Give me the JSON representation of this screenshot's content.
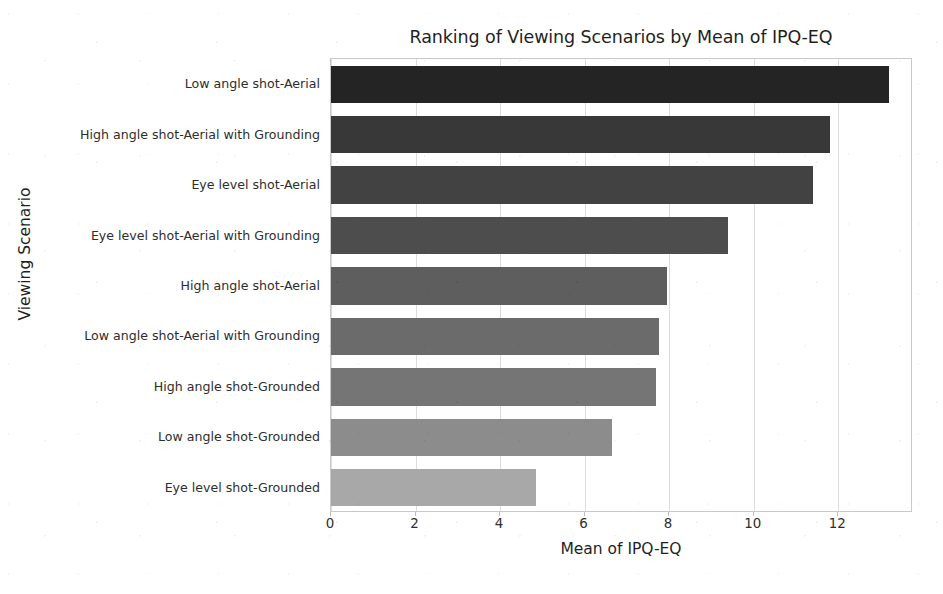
{
  "chart_data": {
    "type": "bar",
    "orientation": "horizontal",
    "title": "Ranking of Viewing Scenarios by Mean of IPQ-EQ",
    "xlabel": "Mean of IPQ-EQ",
    "ylabel": "Viewing Scenario",
    "xlim": [
      0,
      13.77
    ],
    "xticks": [
      0,
      2,
      4,
      6,
      8,
      10,
      12
    ],
    "xticklabels": [
      "0",
      "2",
      "4",
      "6",
      "8",
      "10",
      "12"
    ],
    "grid": "vertical-only",
    "legend": "none",
    "categories": [
      "Low angle shot-Aerial",
      "High angle shot-Aerial with Grounding",
      "Eye level shot-Aerial",
      "Eye level shot-Aerial with Grounding",
      "High angle shot-Aerial",
      "Low angle shot-Aerial with Grounding",
      "High angle shot-Grounded",
      "Low angle shot-Grounded",
      "Eye level shot-Grounded"
    ],
    "values": [
      13.2,
      11.8,
      11.4,
      9.4,
      7.95,
      7.75,
      7.7,
      6.65,
      4.85
    ],
    "bar_colors": [
      "#242424",
      "#383838",
      "#424242",
      "#4d4d4d",
      "#5e5e5e",
      "#6b6b6b",
      "#757575",
      "#8c8c8c",
      "#a8a8a8"
    ]
  },
  "figure": {
    "background_color": "#ffffff",
    "axes_edge_color": "#c9c9c9",
    "grid_color": "#dcdcdc",
    "text_color": "#262626"
  }
}
